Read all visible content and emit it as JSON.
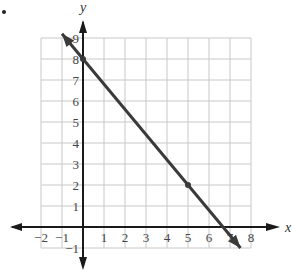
{
  "bullet": "•",
  "chart_data": {
    "type": "line",
    "title": "",
    "xlabel": "x",
    "ylabel": "y",
    "xlim": [
      -2,
      8
    ],
    "ylim": [
      -1,
      9
    ],
    "grid": true,
    "x_ticks": [
      "−2",
      "−1",
      "1",
      "2",
      "3",
      "4",
      "5",
      "6",
      "7",
      "8"
    ],
    "y_ticks": [
      "−1",
      "1",
      "2",
      "3",
      "4",
      "5",
      "6",
      "7",
      "8",
      "9"
    ],
    "series": [
      {
        "name": "line",
        "equation": "y = -6/5 x + 8",
        "slope": -1.2,
        "intercept": 8,
        "arrows_both_ends": true,
        "x": [
          -1,
          7.5
        ],
        "y": [
          9.2,
          -1
        ]
      }
    ],
    "marked_points": [
      {
        "x": 0,
        "y": 8
      },
      {
        "x": 5,
        "y": 2
      }
    ],
    "colors": {
      "line": "#3a3a3a",
      "grid": "#c8c8c8",
      "axis": "#1a1a1a"
    }
  }
}
